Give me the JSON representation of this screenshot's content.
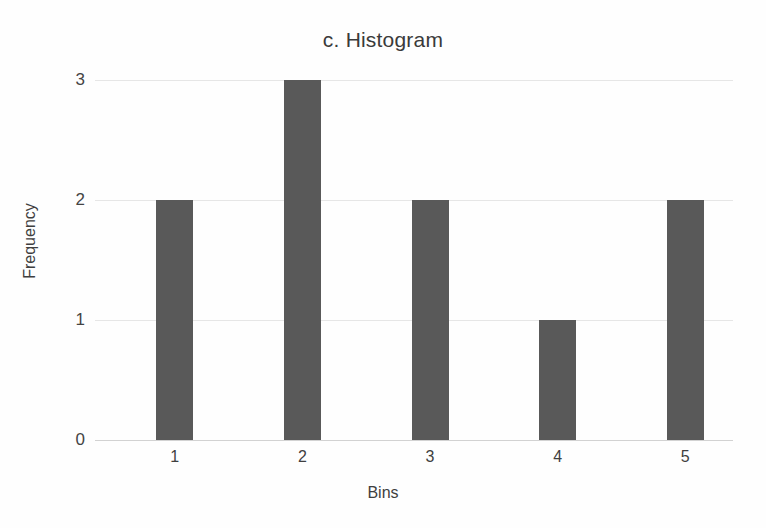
{
  "chart_data": {
    "type": "bar",
    "title": "c. Histogram",
    "xlabel": "Bins",
    "ylabel": "Frequency",
    "categories": [
      "1",
      "2",
      "3",
      "4",
      "5"
    ],
    "values": [
      2,
      3,
      2,
      1,
      2
    ],
    "ylim": [
      0,
      3
    ],
    "yticks": [
      0,
      1,
      2,
      3
    ],
    "ytick_labels": [
      "0",
      "1",
      "2",
      "3"
    ],
    "grid": true,
    "legend": "none",
    "bar_color": "#595959",
    "gridline_color": "#e6e6e6",
    "background_color": "#fefefe",
    "title_color": "#3a3a3a",
    "bars": [
      {
        "bin": "1",
        "frequency": 2
      },
      {
        "bin": "2",
        "frequency": 3
      },
      {
        "bin": "3",
        "frequency": 2
      },
      {
        "bin": "4",
        "frequency": 1
      },
      {
        "bin": "5",
        "frequency": 2
      }
    ]
  }
}
